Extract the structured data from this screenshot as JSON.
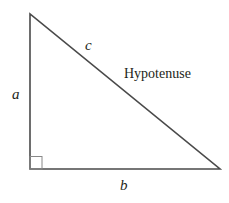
{
  "diagram": {
    "type": "right-triangle",
    "vertices": {
      "top": [
        30,
        14
      ],
      "right_angle": [
        30,
        169
      ],
      "bottom_right": [
        220,
        169
      ]
    },
    "labels": {
      "side_a": "a",
      "side_b": "b",
      "side_c": "c",
      "hypotenuse": "Hypotenuse"
    },
    "colors": {
      "stroke": "#4a4a4a",
      "right_angle_marker": "#888888",
      "text": "#231f20"
    }
  }
}
